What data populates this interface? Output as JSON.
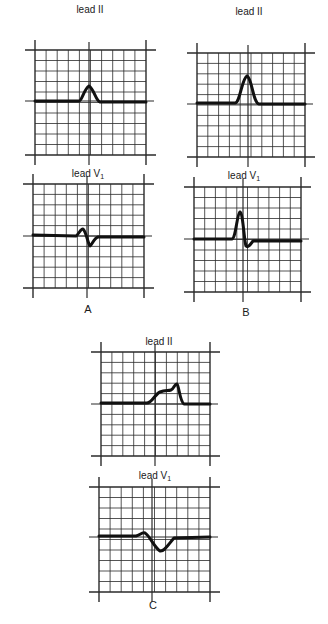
{
  "figure": {
    "panels": [
      {
        "id": "A",
        "letter": "A",
        "letter_pos": [
          78,
          303
        ],
        "leads": [
          {
            "name": "lead II",
            "label_main": "lead II",
            "label_sub": "",
            "label_pos": [
              50,
              4
            ],
            "grid": {
              "left": 35,
              "right": 146,
              "top": 50,
              "bottom": 155,
              "center_x": 89,
              "baseline": 101
            },
            "waveform": "upright narrow P wave centered on axis"
          },
          {
            "name": "lead V1",
            "label_main": "lead V",
            "label_sub": "1",
            "label_pos": [
              48,
              168
            ],
            "grid": {
              "left": 33,
              "right": 144,
              "top": 184,
              "bottom": 288,
              "center_x": 87,
              "baseline": 236
            },
            "waveform": "small biphasic P wave: small positive then small negative deflection"
          }
        ]
      },
      {
        "id": "B",
        "letter": "B",
        "letter_pos": [
          236,
          306
        ],
        "leads": [
          {
            "name": "lead II",
            "label_main": "lead II",
            "label_sub": "",
            "label_pos": [
              209,
              6
            ],
            "grid": {
              "left": 197,
              "right": 305,
              "top": 53,
              "bottom": 157,
              "center_x": 248,
              "baseline": 104
            },
            "waveform": "tall peaked P wave"
          },
          {
            "name": "lead V1",
            "label_main": "lead V",
            "label_sub": "1",
            "label_pos": [
              204,
              170
            ],
            "grid": {
              "left": 194,
              "right": 301,
              "top": 187,
              "bottom": 292,
              "center_x": 243,
              "baseline": 239
            },
            "waveform": "tall positive P wave with small terminal negative deflection"
          }
        ]
      },
      {
        "id": "C",
        "letter": "C",
        "letter_pos": [
          143,
          599
        ],
        "leads": [
          {
            "name": "lead II",
            "label_main": "lead II",
            "label_sub": "",
            "label_pos": [
              119,
              336
            ],
            "grid": {
              "left": 101,
              "right": 210,
              "top": 352,
              "bottom": 456,
              "center_x": 155,
              "baseline": 404
            },
            "waveform": "broad notched (bifid) P wave"
          },
          {
            "name": "lead V1",
            "label_main": "lead V",
            "label_sub": "1",
            "label_pos": [
              115,
              470
            ],
            "grid": {
              "left": 99,
              "right": 210,
              "top": 487,
              "bottom": 592,
              "center_x": 152,
              "baseline": 537
            },
            "waveform": "biphasic P wave with small positive and broad deep negative terminal component"
          }
        ]
      }
    ],
    "grid_divisions": {
      "columns": 10,
      "rows": 10
    },
    "colors": {
      "grid": "#2a2a2a",
      "trace": "#111111",
      "background": "#ffffff"
    }
  }
}
